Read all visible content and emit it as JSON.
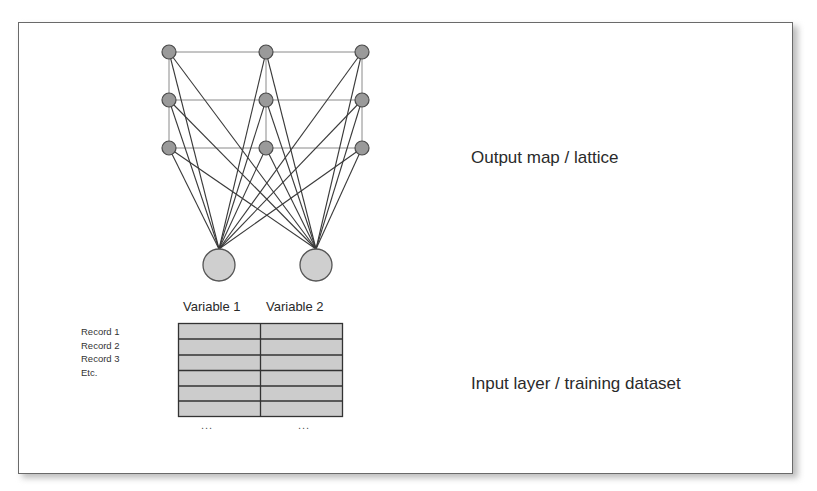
{
  "diagram": {
    "title_output": "Output map / lattice",
    "title_input": "Input layer / training dataset",
    "variables": [
      "Variable 1",
      "Variable 2"
    ],
    "records": [
      "Record 1",
      "Record 2",
      "Record 3",
      "Etc."
    ],
    "ellipsis": [
      "...",
      "..."
    ],
    "output_grid": {
      "columns": 3,
      "rows": 3
    },
    "input_nodes": 2,
    "table": {
      "rows": 6,
      "columns": 2
    },
    "colors": {
      "output_node_fill": "#9a9a9a",
      "input_node_fill": "#cfcfcf",
      "table_fill": "#cccccc",
      "line": "#3a3a3a",
      "lattice_line": "#8a8a8a",
      "frame_border": "#6a6a6a"
    }
  }
}
